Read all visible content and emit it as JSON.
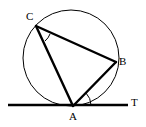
{
  "figure": {
    "kind": "circle-geometry-diagram",
    "background_color": "#ffffff",
    "stroke_color": "#000000",
    "canvas": {
      "width": 146,
      "height": 127
    },
    "labels": {
      "vertex_c": "C",
      "vertex_b": "B",
      "vertex_a": "A",
      "tangent_end": "T"
    },
    "circle": {
      "center_x": 71,
      "center_y": 58,
      "radius": 48,
      "stroke_width": 1
    },
    "points": {
      "A": {
        "x": 73,
        "y": 106
      },
      "B": {
        "x": 116,
        "y": 62
      },
      "C": {
        "x": 36,
        "y": 26
      },
      "T": {
        "x": 128,
        "y": 105
      }
    },
    "segments": [
      {
        "name": "chord-CB",
        "x1": 36,
        "y1": 26,
        "x2": 116,
        "y2": 62,
        "stroke_width": 2.4
      },
      {
        "name": "chord-CA",
        "x1": 36,
        "y1": 26,
        "x2": 73,
        "y2": 106,
        "stroke_width": 2.4
      },
      {
        "name": "chord-AB",
        "x1": 73,
        "y1": 106,
        "x2": 116,
        "y2": 62,
        "stroke_width": 2.4
      },
      {
        "name": "tangent-line",
        "x1": 8,
        "y1": 105,
        "x2": 128,
        "y2": 105,
        "stroke_width": 2.4
      }
    ],
    "angle_marks": [
      {
        "name": "angle-at-c",
        "path": "M 50 34 A 16 16 0 0 1 45 41",
        "stroke_width": 1
      },
      {
        "name": "angle-at-a",
        "path": "M 91 105 A 18 18 0 0 0 86 93",
        "stroke_width": 1
      }
    ]
  }
}
